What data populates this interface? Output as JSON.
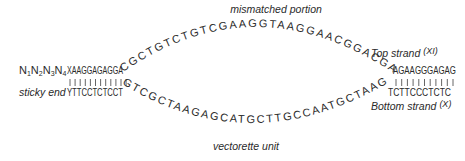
{
  "labels": {
    "mismatched": "mismatched portion",
    "sticky_end": "sticky end",
    "vectorette": "vectorette unit",
    "top_strand": "Top strand",
    "top_strand_sup": "(XI)",
    "bottom_strand": "Bottom strand",
    "bottom_strand_sup": "(X)"
  },
  "sequences": {
    "overhang_prefix": "N1N2N3N4",
    "overhang_parts": [
      "N",
      "1",
      "N",
      "2",
      "N",
      "3",
      "N",
      "4"
    ],
    "left_top": "XAAGGAGAGGA",
    "left_bottom": "YTTCCTCTCCT",
    "top_arc": "CGCTGTCTGTCGAAGGTAAGGAACGGACGAG",
    "bottom_arc": "GTCGCTAAGAGCATGCTTGCCAATGCTAAGC",
    "right_top": "AGAAGGGAGAG",
    "right_bottom": "TCTTCCCTCTC"
  },
  "pairing": {
    "left_ticks": 12,
    "right_ticks": 11
  }
}
